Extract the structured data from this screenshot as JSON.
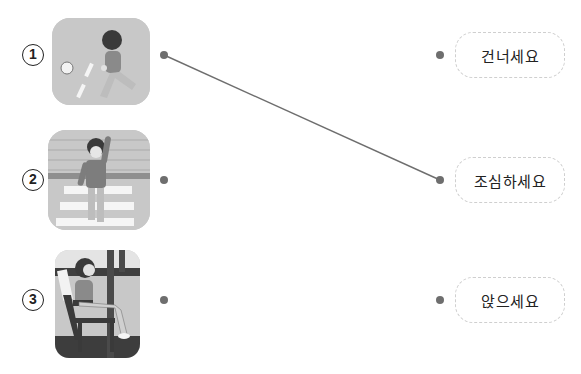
{
  "items": [
    {
      "number": "1",
      "picture": "child running after ball on road",
      "dot_y": 55
    },
    {
      "number": "2",
      "picture": "child raising hand at crosswalk",
      "dot_y": 180
    },
    {
      "number": "3",
      "picture": "child sitting on chair",
      "dot_y": 300
    }
  ],
  "words": [
    {
      "label": "건너세요",
      "dot_y": 55
    },
    {
      "label": "조심하세요",
      "dot_y": 180
    },
    {
      "label": "앉으세요",
      "dot_y": 300
    }
  ],
  "connections": [
    {
      "from_item": "1",
      "to_word": "조심하세요",
      "x1": 164,
      "y1": 55,
      "x2": 440,
      "y2": 180
    }
  ],
  "colors": {
    "dot": "#6e6e6e",
    "line": "#6e6e6e",
    "box_border": "#cfcfcf",
    "text": "#222222"
  }
}
